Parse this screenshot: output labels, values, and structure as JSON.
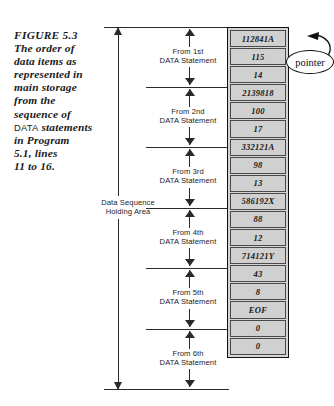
{
  "figure": {
    "caption_lines": [
      "FIGURE 5.3",
      "The order of",
      "data items as",
      "represented in",
      "main storage",
      "from the",
      "sequence of",
      "in Program",
      "5.1, lines",
      "11 to 16."
    ],
    "caption_mono_word": "DATA",
    "caption_mono_tail": "statements"
  },
  "span": {
    "label_line1": "Data Sequence",
    "label_line2": "Holding Area"
  },
  "groups": [
    {
      "line1": "From 1st",
      "line2": "DATA Statement"
    },
    {
      "line1": "From 2nd",
      "line2": "DATA Statement"
    },
    {
      "line1": "From 3rd",
      "line2": "DATA Statement"
    },
    {
      "line1": "From 4th",
      "line2": "DATA Statement"
    },
    {
      "line1": "From 5th",
      "line2": "DATA Statement"
    },
    {
      "line1": "From 6th",
      "line2": "DATA Statement"
    }
  ],
  "memory": {
    "cells": [
      "112841A",
      "115",
      "14",
      "2139818",
      "100",
      "17",
      "332121A",
      "98",
      "13",
      "586192X",
      "88",
      "12",
      "714121Y",
      "43",
      "8",
      "EOF",
      "0",
      "0"
    ]
  },
  "callout": {
    "pointer_label": "pointer"
  },
  "colors": {
    "ink": "#1a1a1a",
    "cell_fill": "#d0d0d0",
    "cell_border": "#4a4a4a",
    "column_border": "#111111",
    "page_bg": "#ffffff"
  }
}
